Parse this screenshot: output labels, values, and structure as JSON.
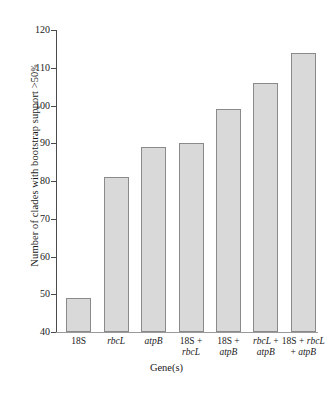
{
  "chart_data": {
    "type": "bar",
    "title": "",
    "xlabel": "Gene(s)",
    "ylabel": "Number of clades with bootstrap support >50%",
    "categories": [
      "18S",
      "rbcL",
      "atpB",
      "18S + rbcL",
      "18S + atpB",
      "rbcL + atpB",
      "18S + rbcL + atpB"
    ],
    "category_lines": [
      [
        "18S"
      ],
      [
        "rbcL"
      ],
      [
        "atpB"
      ],
      [
        "18S +",
        "rbcL"
      ],
      [
        "18S +",
        "atpB"
      ],
      [
        "rbcL +",
        "atpB"
      ],
      [
        "18S + rbcL",
        "+ atpB"
      ]
    ],
    "values": [
      49,
      81,
      89,
      90,
      99,
      106,
      114
    ],
    "ylim": [
      40,
      120
    ],
    "yticks": [
      40,
      50,
      60,
      70,
      80,
      90,
      100,
      110,
      120
    ],
    "ytick_labels": [
      "40",
      "50",
      "60",
      "70",
      "80",
      "90",
      "100",
      "110",
      "120"
    ],
    "grid": false,
    "legend": "none",
    "bar_fill": "#d9d9d9",
    "bar_edge": "#8a8a8a",
    "axis_color": "#4a4a4a"
  },
  "axis_titles": {
    "y_main": "Number of clades with bootstrap support >50",
    "y_pct": "%",
    "x": "Gene(s)"
  }
}
